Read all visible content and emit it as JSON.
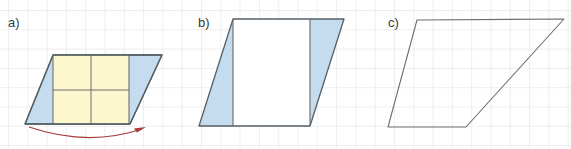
{
  "figure": {
    "width": 571,
    "height": 149,
    "background_color": "#ffffff"
  },
  "grid": {
    "visible": true,
    "spacing_px": 19.3,
    "origin_x": 8,
    "origin_y": 10,
    "line_color": "#dcdcdc",
    "line_width": 1
  },
  "palette": {
    "outline": "#555f66",
    "outline_dark": "#4a535a",
    "fill_blue": "#c5dcee",
    "fill_yellow": "#fcf7cd",
    "fill_white": "#ffffff",
    "inner_line": "#6d6f72",
    "arrow": "#a83b3b",
    "label_text": "#3a3a3a"
  },
  "panels": [
    {
      "id": "a",
      "label": "a)",
      "label_position": {
        "x": 8,
        "y": 16
      },
      "description": "Parallelogram with central yellow rectangle and two blue triangular end pieces, with a curved red arrow beneath indicating the left triangle moves to the right side.",
      "parallelogram": {
        "points": "25,124 53,55 162,55 130,124",
        "stroke": "#555f66",
        "stroke_width": 1.2,
        "fill": "#c5dcee"
      },
      "inner_rectangle": {
        "points": "53,55 129,55 129,124 53,124",
        "fill": "#fcf7cd",
        "stroke": "#6d6f72",
        "stroke_width": 1.1
      },
      "inner_rect_divider_lines": [
        {
          "type": "vertical",
          "x1": 91,
          "y1": 55,
          "x2": 91,
          "y2": 124
        },
        {
          "type": "horizontal",
          "x1": 53,
          "y1": 90,
          "x2": 129,
          "y2": 90
        }
      ],
      "arrow": {
        "type": "curved-arrow",
        "color": "#a83b3b",
        "path": "M 30,127 Q 88,148 144,128",
        "head_at": {
          "x": 144,
          "y": 128
        },
        "direction": "left-to-right"
      }
    },
    {
      "id": "b",
      "label": "b)",
      "label_position": {
        "x": 198,
        "y": 16
      },
      "description": "Parallelogram divided by two vertical lines into a blue left triangle-like band, a white middle band and a blue right band.",
      "parallelogram": {
        "points": "199,126 233,19 344,19 310,126",
        "stroke": "#555f66",
        "stroke_width": 1.2,
        "fill": "#ffffff"
      },
      "blue_regions": [
        {
          "name": "left-band",
          "points": "199,126 233,19 233,126",
          "fill": "#c5dcee"
        },
        {
          "name": "right-band",
          "points": "310,126 310,19 344,19",
          "fill": "#c5dcee"
        }
      ],
      "divider_lines": [
        {
          "type": "vertical",
          "x1": 233,
          "y1": 19,
          "x2": 233,
          "y2": 126
        },
        {
          "type": "vertical",
          "x1": 310,
          "y1": 19,
          "x2": 310,
          "y2": 126
        }
      ]
    },
    {
      "id": "c",
      "label": "c)",
      "label_position": {
        "x": 388,
        "y": 16
      },
      "description": "Plain unshaded parallelogram outline.",
      "parallelogram": {
        "points": "388,127 417,20 564,19 466,127",
        "stroke": "#6b6f73",
        "stroke_width": 1.1,
        "fill": "none"
      }
    }
  ]
}
